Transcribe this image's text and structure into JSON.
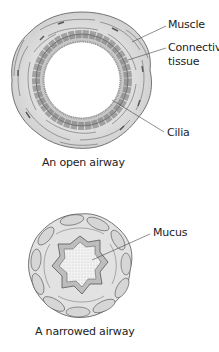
{
  "open_airway": {
    "caption": "An open airway",
    "labels": {
      "muscle": "Muscle",
      "connective_1": "Connective",
      "connective_2": "tissue",
      "cilia": "Cilia"
    }
  },
  "narrowed_airway": {
    "caption": "A narrowed airway",
    "labels": {
      "mucus": "Mucus"
    }
  },
  "colors": {
    "line": "#555555",
    "tissue_fill": "#e4e4e4",
    "cell_fill": "#b8b8b8",
    "lumen": "#ffffff"
  }
}
